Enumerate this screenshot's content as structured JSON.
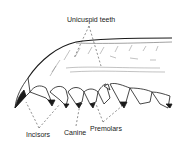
{
  "diagram": {
    "labels": {
      "unicuspid": "Unicuspid teeth",
      "incisors": "Incisors",
      "canine": "Canine",
      "premolars": "Premolars"
    },
    "colors": {
      "ink": "#1a1a1a",
      "background": "#ffffff"
    }
  }
}
